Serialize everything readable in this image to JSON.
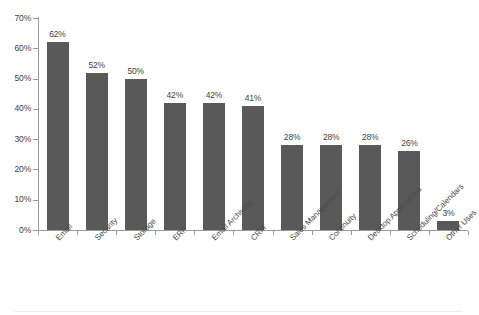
{
  "chart_data": {
    "type": "bar",
    "title": "",
    "xlabel": "",
    "ylabel": "",
    "ylim": [
      0,
      70
    ],
    "ytick_labels": [
      "0%",
      "10%",
      "20%",
      "30%",
      "40%",
      "50%",
      "60%",
      "70%"
    ],
    "ytick_values": [
      0,
      10,
      20,
      30,
      40,
      50,
      60,
      70
    ],
    "grid": false,
    "legend": false,
    "bar_color": "#595959",
    "axis_color": "#9a9a9a",
    "label_color": "#3f3f3f",
    "value_label_suffix": "%",
    "categories": [
      "Email",
      "Security",
      "Storage",
      "ERP",
      "Email Archiving",
      "CRM",
      "Sales Management",
      "Continuity",
      "Desktop Applications",
      "Scheduling/Calendars",
      "Other Uses"
    ],
    "values": [
      62,
      52,
      50,
      42,
      42,
      41,
      28,
      28,
      28,
      26,
      3
    ],
    "value_labels": [
      "62%",
      "52%",
      "50%",
      "42%",
      "42%",
      "41%",
      "28%",
      "28%",
      "28%",
      "26%",
      "3%"
    ]
  }
}
